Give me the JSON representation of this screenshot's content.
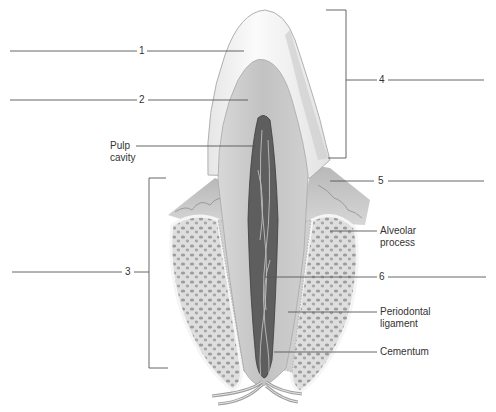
{
  "diagram": {
    "colors": {
      "background": "#ffffff",
      "leader_line": "#555555",
      "label_text": "#333333",
      "enamel": "#f4f4f4",
      "dentin": "#c9c9c9",
      "pulp": "#5e5e5e",
      "gum": "#bdbdbd",
      "bone": "#dcdcdc",
      "bone_pores": "#9a9a9a"
    },
    "numbered_labels": [
      {
        "id": "1",
        "text": "1"
      },
      {
        "id": "2",
        "text": "2"
      },
      {
        "id": "3",
        "text": "3"
      },
      {
        "id": "4",
        "text": "4"
      },
      {
        "id": "5",
        "text": "5"
      },
      {
        "id": "6",
        "text": "6"
      }
    ],
    "text_labels": {
      "pulp_cavity": {
        "line1": "Pulp",
        "line2": "cavity"
      },
      "alveolar_process": {
        "line1": "Alveolar",
        "line2": "process"
      },
      "periodontal_ligament": {
        "line1": "Periodontal",
        "line2": "ligament"
      },
      "cementum": {
        "line1": "Cementum"
      }
    }
  }
}
